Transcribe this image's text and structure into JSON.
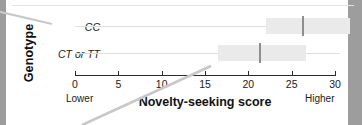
{
  "figure": {
    "y_axis_title": "Genotype",
    "x_axis_title": "Novelty-seeking score",
    "anchor_low": "Lower",
    "anchor_high": "Higher",
    "colors": {
      "box_fill": "#eaeaea",
      "median": "#8e8e8e",
      "axis": "#2b2b2b",
      "gridline": "#dedede",
      "leader_line": "#c8c8c8",
      "page_gutter": "#9d9d9d"
    }
  },
  "chart_data": {
    "type": "bar",
    "title": "",
    "subtitle": "",
    "xlabel": "Novelty-seeking score",
    "ylabel": "Genotype",
    "xlim": [
      0,
      30
    ],
    "xticks": [
      0,
      5,
      10,
      15,
      20,
      25,
      30
    ],
    "xtick_labels": [
      "0",
      "5",
      "10",
      "15",
      "20",
      "25",
      "30"
    ],
    "grid": false,
    "legend": "none",
    "orientation": "horizontal",
    "annotations": [
      "Lower",
      "Higher"
    ],
    "categories": [
      "CC",
      "CT or TT"
    ],
    "series": [
      {
        "name": "Novelty-seeking score (box)",
        "boxes": [
          {
            "category": "CC",
            "q1": 22.0,
            "median": 26.3,
            "q3": 31.7
          },
          {
            "category": "CT or TT",
            "q1": 16.5,
            "median": 21.3,
            "q3": 26.7
          }
        ]
      }
    ],
    "values": [
      26.3,
      21.3
    ]
  },
  "ticks": [
    {
      "label": "0",
      "value": 0
    },
    {
      "label": "5",
      "value": 5
    },
    {
      "label": "10",
      "value": 10
    },
    {
      "label": "15",
      "value": 15
    },
    {
      "label": "20",
      "value": 20
    },
    {
      "label": "25",
      "value": 25
    },
    {
      "label": "30",
      "value": 30
    }
  ]
}
